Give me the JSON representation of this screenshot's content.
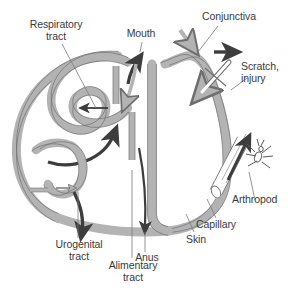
{
  "figure": {
    "type": "biological-schematic",
    "background_color": "#ffffff",
    "tube_fill_color": "#b3b3b3",
    "tube_stroke_color": "#6e6e6e",
    "dark_arrow_color": "#3d3d3d",
    "light_arrow_color": "#b3b3b3",
    "label_color": "#3a3a3a",
    "leader_line_color": "#7a7a7a"
  },
  "labels": {
    "respiratory_tract": "Respiratory\ntract",
    "mouth": "Mouth",
    "conjunctiva": "Conjunctiva",
    "scratch_injury": "Scratch,\ninjury",
    "arthropod": "Arthropod",
    "capillary": "Capillary",
    "skin": "Skin",
    "anus": "Anus",
    "alimentary_tract": "Alimentary\ntract",
    "urogenital_tract": "Urogenital\ntract"
  },
  "structures": [
    {
      "name": "skin-barrier",
      "description": "Thick gray band forming outer body boundary"
    },
    {
      "name": "respiratory-tract-tube",
      "description": "Looping tube at upper left ending blind"
    },
    {
      "name": "alimentary-tract-tube",
      "description": "Long tube from mouth to anus"
    },
    {
      "name": "urogenital-tract-tube",
      "description": "Short looping tube at lower left"
    },
    {
      "name": "capillary-vessel",
      "description": "Diagonal cylinder beneath skin on right"
    },
    {
      "name": "arthropod",
      "description": "Small insect on outer skin surface"
    }
  ],
  "entry_routes": [
    {
      "name": "mouth",
      "direction": "inward",
      "arrow_style": "light"
    },
    {
      "name": "mouth-exit",
      "direction": "outward",
      "arrow_style": "dark"
    },
    {
      "name": "respiratory",
      "direction": "inward",
      "arrow_style": "dark"
    },
    {
      "name": "conjunctiva",
      "direction": "inward",
      "arrow_style": "light"
    },
    {
      "name": "skin-surface",
      "direction": "outward",
      "arrow_style": "dark"
    },
    {
      "name": "scratch-injury",
      "direction": "inward",
      "arrow_style": "outline"
    },
    {
      "name": "arthropod-bite",
      "direction": "inward",
      "arrow_style": "dark"
    },
    {
      "name": "anus",
      "direction": "outward",
      "arrow_style": "dark"
    },
    {
      "name": "urogenital",
      "direction": "outward",
      "arrow_style": "dark"
    },
    {
      "name": "urogenital-entry",
      "direction": "inward",
      "arrow_style": "outline"
    }
  ]
}
